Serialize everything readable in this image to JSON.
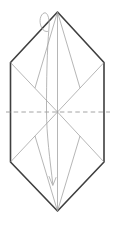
{
  "figure": {
    "colors": {
      "background": "#ffffff",
      "outline": "#3f3f3f",
      "crease": "#969696",
      "dashed_fold": "#9a9a9a",
      "arrow": "#a3a3a3"
    },
    "canvas": {
      "width": 114,
      "height": 225
    },
    "outline": {
      "points": "57.5,12 104,62.5 104,162 57.5,211 10.5,162 10.5,62.5"
    },
    "creases": [
      {
        "type": "thin",
        "x1": 57.5,
        "y1": 12,
        "x2": 57.5,
        "y2": 211
      },
      {
        "type": "thin",
        "x1": 10.5,
        "y1": 62.5,
        "x2": 57.5,
        "y2": 112
      },
      {
        "type": "thin",
        "x1": 104,
        "y1": 62.5,
        "x2": 57.5,
        "y2": 112
      },
      {
        "type": "thin",
        "x1": 10.5,
        "y1": 162,
        "x2": 57.5,
        "y2": 112
      },
      {
        "type": "thin",
        "x1": 104,
        "y1": 162,
        "x2": 57.5,
        "y2": 112
      },
      {
        "type": "thin",
        "x1": 57.5,
        "y1": 12,
        "x2": 35,
        "y2": 88
      },
      {
        "type": "thin",
        "x1": 57.5,
        "y1": 12,
        "x2": 80,
        "y2": 88
      },
      {
        "type": "thin",
        "x1": 57.5,
        "y1": 211,
        "x2": 35,
        "y2": 136
      },
      {
        "type": "thin",
        "x1": 57.5,
        "y1": 211,
        "x2": 80,
        "y2": 136
      },
      {
        "type": "dashed",
        "x1": 6,
        "y1": 112,
        "x2": 110,
        "y2": 112
      }
    ],
    "arrow": {
      "curve_d": "M 52.8,184 C 50,160 46.5,135 46.5,110 C 46.5,80 47,50 49,28 C 50,19 47.5,11.5 44,13 C 40.5,14.5 38.5,21 41.5,27.5 C 43,30.5 45.5,32 47.5,31.5",
      "head_d": "M 49,176.5 L 52.8,185.5 L 56,177.5"
    }
  }
}
